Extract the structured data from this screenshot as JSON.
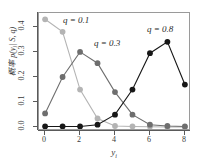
{
  "chart_data": {
    "type": "line",
    "title": "",
    "subtitle": "",
    "xlabel": "y_i",
    "ylabel": "概率 p(y_i | S, q)",
    "x": [
      0,
      1,
      2,
      3,
      4,
      5,
      6,
      7,
      8
    ],
    "xlim": [
      -0.35,
      8.35
    ],
    "ylim": [
      -0.015,
      0.455
    ],
    "xticks": [
      0,
      2,
      4,
      6,
      8
    ],
    "xtick_labels": [
      "0",
      "2",
      "4",
      "6",
      "8"
    ],
    "yticks": [
      0.0,
      0.1,
      0.2,
      0.3,
      0.4
    ],
    "ytick_labels": [
      "0.0",
      "0.1",
      "0.2",
      "0.3",
      "0.4"
    ],
    "grid": false,
    "legend_position": "inline-annotations",
    "series": [
      {
        "name": "q = 0.1",
        "color": "#b4b4b4",
        "marker": "filled-circle",
        "values": [
          0.43,
          0.38,
          0.15,
          0.035,
          0.005,
          0.003,
          0.002,
          0.001,
          0.001
        ]
      },
      {
        "name": "q = 0.3",
        "color": "#6e6e6e",
        "marker": "filled-circle",
        "values": [
          0.055,
          0.2,
          0.3,
          0.255,
          0.14,
          0.05,
          0.01,
          0.005,
          0.003
        ]
      },
      {
        "name": "q = 0.8",
        "color": "#171717",
        "marker": "filled-circle",
        "values": [
          0.003,
          0.003,
          0.003,
          0.01,
          0.05,
          0.15,
          0.295,
          0.34,
          0.17
        ]
      }
    ],
    "annotations": [
      {
        "text": "q = 0.1",
        "x_px": 63,
        "y_px": 15
      },
      {
        "text": "q = 0.3",
        "x_px": 94,
        "y_px": 38
      },
      {
        "text": "q = 0.8",
        "x_px": 147,
        "y_px": 24
      }
    ]
  },
  "axes": {
    "xlabel_main": "y",
    "xlabel_sub": "i",
    "ylabel_text": "概率 p(y",
    "ylabel_sub": "i",
    "ylabel_tail": "| S, q)"
  }
}
